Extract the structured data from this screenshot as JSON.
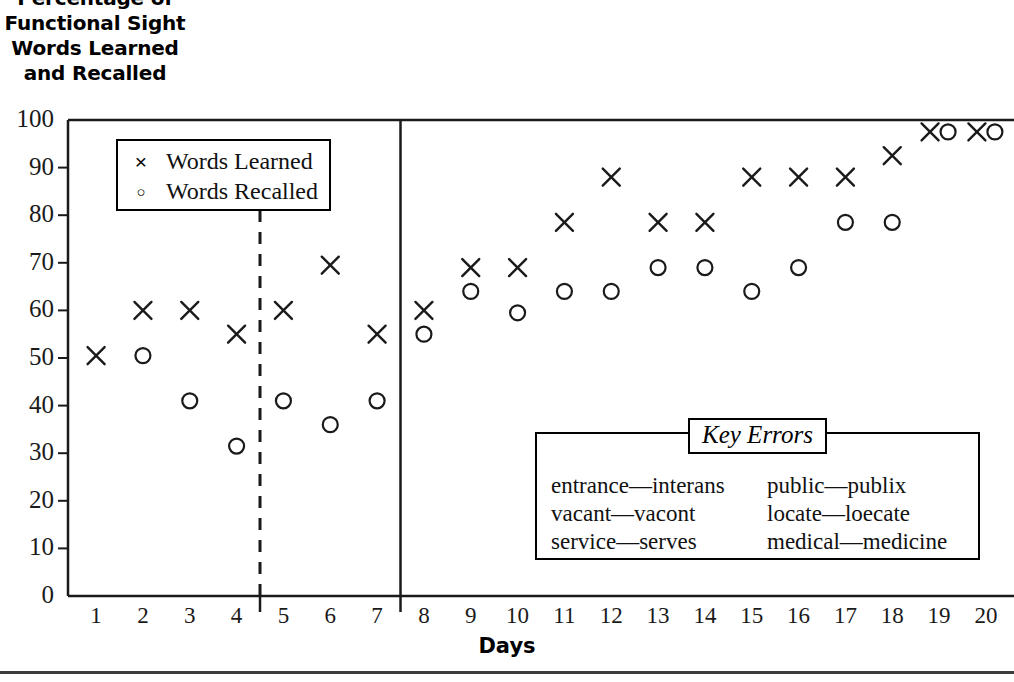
{
  "title": "Percentage of\nFunctional Sight\nWords Learned\nand Recalled",
  "axis": {
    "xlabel": "Days",
    "ylabel": ""
  },
  "legend": {
    "items": [
      {
        "marker": "x-marker",
        "glyph": "×",
        "label": "Words Learned"
      },
      {
        "marker": "o-marker",
        "glyph": "○",
        "label": "Words Recalled"
      }
    ]
  },
  "key_errors": {
    "title": "Key Errors",
    "columns": [
      [
        "entrance—interans",
        "vacant—vacont",
        "service—serves"
      ],
      [
        "public—publix",
        "locate—loecate",
        "medical—medicine"
      ]
    ]
  },
  "chart_data": {
    "type": "scatter",
    "title": "Percentage of Functional Sight Words Learned and Recalled",
    "xlabel": "Days",
    "ylabel": "",
    "xlim": [
      0.4,
      20.6
    ],
    "ylim": [
      0,
      100
    ],
    "xticks": [
      1,
      2,
      3,
      4,
      5,
      6,
      7,
      8,
      9,
      10,
      11,
      12,
      13,
      14,
      15,
      16,
      17,
      18,
      19,
      20
    ],
    "yticks": [
      0,
      10,
      20,
      30,
      40,
      50,
      60,
      70,
      80,
      90,
      100
    ],
    "grid": false,
    "legend_position": "upper-left",
    "phase_dividers": [
      {
        "x": 4.5,
        "style": "dashed",
        "name": "baseline-divider"
      },
      {
        "x": 7.5,
        "style": "solid",
        "name": "phase-divider"
      }
    ],
    "series": [
      {
        "name": "Words Learned",
        "marker": "x",
        "x": [
          1,
          2,
          3,
          4,
          5,
          6,
          7,
          8,
          9,
          10,
          11,
          12,
          13,
          14,
          15,
          16,
          17,
          18,
          19,
          20
        ],
        "values": [
          50.5,
          60,
          60,
          55,
          60,
          69.5,
          55,
          60,
          69,
          69,
          78.5,
          88,
          78.5,
          78.5,
          88,
          88,
          88,
          92.5,
          97.5,
          97.5
        ]
      },
      {
        "name": "Words Recalled",
        "marker": "o",
        "x": [
          2,
          3,
          4,
          5,
          6,
          7,
          8,
          9,
          10,
          11,
          12,
          13,
          14,
          15,
          16,
          17,
          18,
          19,
          20
        ],
        "values": [
          50.5,
          41,
          31.5,
          41,
          36,
          41,
          55,
          64,
          59.5,
          64,
          64,
          69,
          69,
          64,
          69,
          78.5,
          78.5,
          97.5,
          97.5
        ]
      }
    ]
  }
}
